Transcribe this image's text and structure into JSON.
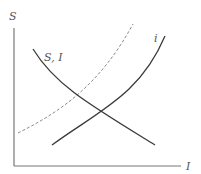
{
  "diagram": {
    "y_axis_label": "S",
    "x_axis_label": "I",
    "curves": [
      {
        "name": "S, I",
        "label": "S, I",
        "style": "solid",
        "slope": "downward",
        "color": "#3a3a3a"
      },
      {
        "name": "i",
        "label": "i",
        "style": "solid",
        "slope": "upward",
        "color": "#3a3a3a"
      },
      {
        "name": "dashed",
        "label": "",
        "style": "dashed",
        "slope": "upward",
        "color": "#888888"
      }
    ],
    "axis_color": "#666666"
  }
}
